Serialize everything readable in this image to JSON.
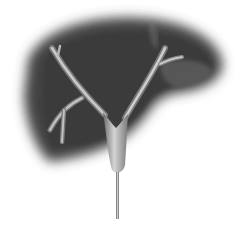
{
  "illustration": {
    "subject": "liver-with-bile-ducts",
    "colors": {
      "background": "#ffffff",
      "liver_dark": "#3a3a3a",
      "liver_mid": "#5a5a5a",
      "duct_light": "#cfcfcf",
      "duct_mid": "#9a9a9a",
      "duct_dark": "#6a6a6a"
    }
  }
}
